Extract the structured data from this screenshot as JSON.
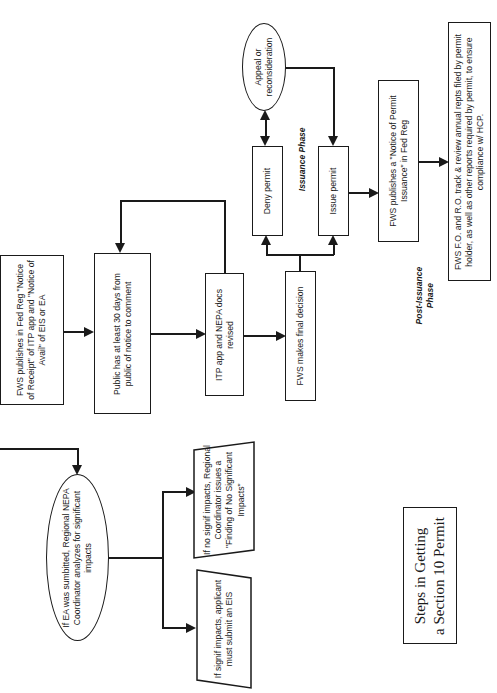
{
  "orientation": "rotated-90-clockwise",
  "title": {
    "line1": "Steps in Getting",
    "line2": "a Section 10 Permit"
  },
  "phases": {
    "issuance": "Issuance Phase",
    "post_issuance_line1": "Post-Issuance",
    "post_issuance_line2": "Phase"
  },
  "nodes": {
    "fed_reg_notice": "FWS publishes in Fed Reg \"Notice of Receipt\" of ITP app and \"Notice of Avail\" of EIS or EA",
    "public_comment": "Public has at least 30 days from public of notice to comment",
    "docs_revised": "ITP app and NEPA docs revised",
    "final_decision": "FWS makes final decision",
    "deny_permit": "Deny permit",
    "issue_permit": "Issue permit",
    "appeal": "Appeal or reconsideration",
    "notice_issuance": "FWS publishes a \"Notice of Permit Issuance\" in Fed Reg",
    "track_reports": "FWS F.O. and R.O. track & review annual repts filed by permit holder, as well as other reports required by permit, to ensure compliance w/ HCP.",
    "ea_analysis": "If EA was sumbitted, Regional NEPA Coordinator analyzes for significant impacts",
    "no_signif": "If no signif impacts, Regional Coordinator issues a \"Finding of No Significant Impacts\"",
    "signif": "If signif impacts, applicant must submit an EIS"
  }
}
